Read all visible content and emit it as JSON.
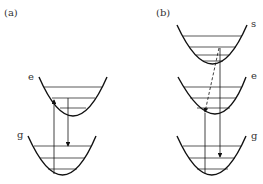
{
  "panels": [
    {
      "label": "(a)",
      "wells": [
        {
          "label": "e"
        },
        {
          "label": "g"
        }
      ]
    },
    {
      "label": "(b)",
      "wells": [
        {
          "label": "s"
        },
        {
          "label": "e"
        },
        {
          "label": "g"
        }
      ]
    }
  ],
  "colors": {
    "stroke": "#111111",
    "text": "#333333"
  }
}
